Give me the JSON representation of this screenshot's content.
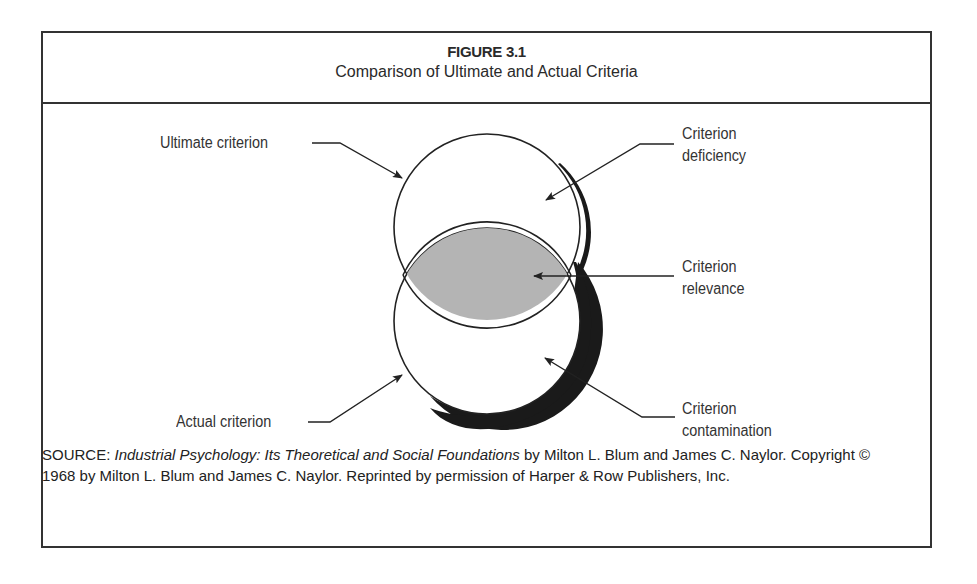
{
  "figure": {
    "number": "FIGURE 3.1",
    "title": "Comparison of Ultimate and Actual Criteria"
  },
  "diagram": {
    "labels": {
      "ultimate": "Ultimate criterion",
      "actual": "Actual criterion",
      "deficiency_1": "Criterion",
      "deficiency_2": "deficiency",
      "relevance_1": "Criterion",
      "relevance_2": "relevance",
      "contamination_1": "Criterion",
      "contamination_2": "contamination"
    },
    "colors": {
      "overlap_fill": "#b4b4b4",
      "stroke": "#222222",
      "shadow": "#1a1a1a"
    }
  },
  "source": {
    "prefix": "SOURCE: ",
    "book_title": "Industrial Psychology: Its Theoretical and Social Foundations",
    "rest_line": " by Milton L. Blum and James C. Naylor. Copyright © 1968 by Milton L. Blum and James C. Naylor. Reprinted by permission of Harper & Row Publishers, Inc."
  }
}
